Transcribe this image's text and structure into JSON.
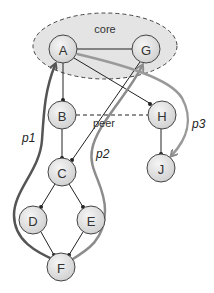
{
  "diagram": {
    "labels": {
      "core": "core",
      "peer": "peer",
      "p1": "p1",
      "p2": "p2",
      "p3": "p3"
    },
    "nodes": [
      {
        "id": "A",
        "label": "A"
      },
      {
        "id": "G",
        "label": "G"
      },
      {
        "id": "B",
        "label": "B"
      },
      {
        "id": "H",
        "label": "H"
      },
      {
        "id": "C",
        "label": "C"
      },
      {
        "id": "J",
        "label": "J"
      },
      {
        "id": "D",
        "label": "D"
      },
      {
        "id": "E",
        "label": "E"
      },
      {
        "id": "F",
        "label": "F"
      }
    ],
    "edges": [
      {
        "from": "A",
        "to": "G",
        "style": "solid"
      },
      {
        "from": "A",
        "to": "B",
        "style": "solid"
      },
      {
        "from": "A",
        "to": "H",
        "style": "solid"
      },
      {
        "from": "G",
        "to": "C",
        "style": "solid"
      },
      {
        "from": "B",
        "to": "C",
        "style": "solid"
      },
      {
        "from": "B",
        "to": "H",
        "style": "dashed",
        "label": "peer"
      },
      {
        "from": "H",
        "to": "J",
        "style": "solid"
      },
      {
        "from": "C",
        "to": "D",
        "style": "solid"
      },
      {
        "from": "C",
        "to": "E",
        "style": "solid"
      },
      {
        "from": "D",
        "to": "F",
        "style": "solid"
      },
      {
        "from": "E",
        "to": "F",
        "style": "solid"
      }
    ],
    "paths": [
      {
        "name": "p1",
        "route": [
          "F",
          "D",
          "C",
          "B",
          "A"
        ],
        "color": "#555555"
      },
      {
        "name": "p2",
        "route": [
          "F",
          "E",
          "C",
          "G"
        ],
        "color": "#888888"
      },
      {
        "name": "p3",
        "route": [
          "A",
          "H",
          "J"
        ],
        "color": "#999999"
      }
    ],
    "colors": {
      "core_fill": "#e4e4e4",
      "node_fill": "#e0e0e0",
      "path_dark": "#555555",
      "path_light": "#8c8c8c"
    }
  }
}
